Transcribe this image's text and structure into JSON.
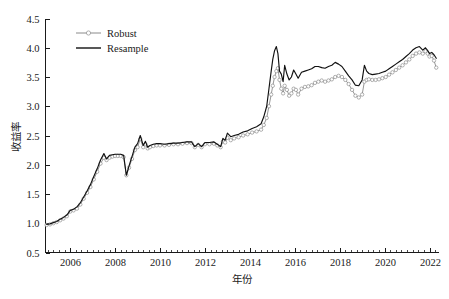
{
  "chart_data": {
    "type": "line",
    "title": "",
    "xlabel": "年份",
    "ylabel": "收益率",
    "xlim": [
      2004.9,
      2022.4
    ],
    "ylim": [
      0.5,
      4.5
    ],
    "grid": false,
    "legend_position": "top-left",
    "x_ticks": [
      2006,
      2008,
      2010,
      2012,
      2014,
      2016,
      2018,
      2020,
      2022
    ],
    "x_tick_labels": [
      "2006",
      "2008",
      "2010",
      "2012",
      "2014",
      "2016",
      "2018",
      "2020",
      "2022"
    ],
    "x_minor_tick_step": 0.25,
    "y_ticks": [
      0.5,
      1.0,
      1.5,
      2.0,
      2.5,
      3.0,
      3.5,
      4.0,
      4.5
    ],
    "y_tick_labels": [
      "0.5",
      "1.0",
      "1.5",
      "2.0",
      "2.5",
      "3.0",
      "3.5",
      "4.0",
      "4.5"
    ],
    "series": [
      {
        "name": "Robust",
        "color": "#8a8a8a",
        "marker": "open-circle",
        "x": [
          2004.95,
          2005.1,
          2005.25,
          2005.4,
          2005.55,
          2005.7,
          2005.85,
          2006.0,
          2006.15,
          2006.3,
          2006.45,
          2006.6,
          2006.75,
          2006.9,
          2007.05,
          2007.2,
          2007.35,
          2007.5,
          2007.62,
          2007.75,
          2007.88,
          2008.0,
          2008.12,
          2008.25,
          2008.38,
          2008.5,
          2008.62,
          2008.75,
          2008.88,
          2009.0,
          2009.12,
          2009.25,
          2009.35,
          2009.45,
          2009.55,
          2009.7,
          2009.85,
          2010.0,
          2010.2,
          2010.4,
          2010.6,
          2010.8,
          2011.0,
          2011.2,
          2011.4,
          2011.55,
          2011.7,
          2011.85,
          2012.0,
          2012.2,
          2012.4,
          2012.55,
          2012.7,
          2012.8,
          2012.9,
          2013.0,
          2013.15,
          2013.3,
          2013.5,
          2013.7,
          2013.9,
          2014.1,
          2014.3,
          2014.5,
          2014.62,
          2014.75,
          2014.85,
          2014.95,
          2015.02,
          2015.1,
          2015.18,
          2015.25,
          2015.32,
          2015.4,
          2015.48,
          2015.55,
          2015.65,
          2015.75,
          2015.85,
          2015.95,
          2016.05,
          2016.15,
          2016.3,
          2016.45,
          2016.6,
          2016.75,
          2016.9,
          2017.05,
          2017.2,
          2017.35,
          2017.5,
          2017.65,
          2017.8,
          2017.95,
          2018.1,
          2018.25,
          2018.4,
          2018.55,
          2018.7,
          2018.85,
          2019.0,
          2019.1,
          2019.2,
          2019.3,
          2019.45,
          2019.6,
          2019.75,
          2019.9,
          2020.05,
          2020.2,
          2020.35,
          2020.5,
          2020.65,
          2020.8,
          2020.95,
          2021.1,
          2021.25,
          2021.4,
          2021.55,
          2021.7,
          2021.82,
          2021.92,
          2022.0,
          2022.1,
          2022.2,
          2022.3
        ],
        "y": [
          0.97,
          0.98,
          1.0,
          1.02,
          1.05,
          1.08,
          1.12,
          1.2,
          1.22,
          1.25,
          1.32,
          1.42,
          1.52,
          1.62,
          1.75,
          1.88,
          2.02,
          2.12,
          2.08,
          2.12,
          2.14,
          2.15,
          2.15,
          2.15,
          2.13,
          1.82,
          1.95,
          2.1,
          2.25,
          2.3,
          2.44,
          2.3,
          2.35,
          2.28,
          2.3,
          2.32,
          2.33,
          2.33,
          2.33,
          2.34,
          2.35,
          2.35,
          2.36,
          2.37,
          2.37,
          2.3,
          2.34,
          2.3,
          2.35,
          2.35,
          2.36,
          2.33,
          2.3,
          2.4,
          2.38,
          2.46,
          2.42,
          2.45,
          2.47,
          2.5,
          2.52,
          2.55,
          2.57,
          2.6,
          2.68,
          2.8,
          3.0,
          3.2,
          3.35,
          3.5,
          3.6,
          3.65,
          3.45,
          3.3,
          3.22,
          3.35,
          3.28,
          3.18,
          3.22,
          3.3,
          3.28,
          3.2,
          3.3,
          3.33,
          3.34,
          3.36,
          3.4,
          3.42,
          3.44,
          3.42,
          3.44,
          3.46,
          3.5,
          3.52,
          3.5,
          3.45,
          3.38,
          3.28,
          3.18,
          3.15,
          3.2,
          3.42,
          3.45,
          3.46,
          3.45,
          3.45,
          3.46,
          3.48,
          3.5,
          3.54,
          3.58,
          3.62,
          3.66,
          3.7,
          3.75,
          3.8,
          3.86,
          3.9,
          3.92,
          3.9,
          3.94,
          3.9,
          3.85,
          3.86,
          3.78,
          3.66
        ]
      },
      {
        "name": "Resample",
        "color": "#111111",
        "marker": "none",
        "x": [
          2004.95,
          2005.1,
          2005.25,
          2005.4,
          2005.55,
          2005.7,
          2005.85,
          2006.0,
          2006.15,
          2006.3,
          2006.45,
          2006.6,
          2006.75,
          2006.9,
          2007.05,
          2007.2,
          2007.35,
          2007.5,
          2007.62,
          2007.75,
          2007.88,
          2008.0,
          2008.12,
          2008.25,
          2008.38,
          2008.5,
          2008.62,
          2008.75,
          2008.88,
          2009.0,
          2009.12,
          2009.25,
          2009.35,
          2009.45,
          2009.55,
          2009.7,
          2009.85,
          2010.0,
          2010.2,
          2010.4,
          2010.6,
          2010.8,
          2011.0,
          2011.2,
          2011.4,
          2011.55,
          2011.7,
          2011.85,
          2012.0,
          2012.2,
          2012.4,
          2012.55,
          2012.7,
          2012.8,
          2012.9,
          2013.0,
          2013.15,
          2013.3,
          2013.5,
          2013.7,
          2013.9,
          2014.1,
          2014.3,
          2014.5,
          2014.62,
          2014.75,
          2014.85,
          2014.95,
          2015.02,
          2015.1,
          2015.18,
          2015.25,
          2015.32,
          2015.4,
          2015.48,
          2015.55,
          2015.65,
          2015.75,
          2015.85,
          2015.95,
          2016.05,
          2016.15,
          2016.3,
          2016.45,
          2016.6,
          2016.75,
          2016.9,
          2017.05,
          2017.2,
          2017.35,
          2017.5,
          2017.65,
          2017.8,
          2017.95,
          2018.1,
          2018.25,
          2018.4,
          2018.55,
          2018.7,
          2018.85,
          2019.0,
          2019.1,
          2019.2,
          2019.3,
          2019.45,
          2019.6,
          2019.75,
          2019.9,
          2020.05,
          2020.2,
          2020.35,
          2020.5,
          2020.65,
          2020.8,
          2020.95,
          2021.1,
          2021.25,
          2021.4,
          2021.55,
          2021.7,
          2021.82,
          2021.92,
          2022.0,
          2022.1,
          2022.2,
          2022.3
        ],
        "y": [
          0.98,
          0.99,
          1.01,
          1.03,
          1.07,
          1.1,
          1.14,
          1.22,
          1.24,
          1.28,
          1.35,
          1.45,
          1.55,
          1.66,
          1.8,
          1.93,
          2.08,
          2.19,
          2.1,
          2.16,
          2.17,
          2.18,
          2.18,
          2.18,
          2.16,
          1.82,
          1.98,
          2.14,
          2.3,
          2.36,
          2.5,
          2.33,
          2.4,
          2.3,
          2.33,
          2.35,
          2.36,
          2.36,
          2.35,
          2.36,
          2.37,
          2.37,
          2.38,
          2.39,
          2.39,
          2.31,
          2.36,
          2.31,
          2.38,
          2.38,
          2.39,
          2.35,
          2.31,
          2.45,
          2.42,
          2.54,
          2.48,
          2.5,
          2.52,
          2.56,
          2.58,
          2.62,
          2.65,
          2.7,
          2.82,
          3.0,
          3.3,
          3.6,
          3.8,
          3.95,
          4.02,
          3.9,
          3.6,
          3.55,
          3.42,
          3.7,
          3.55,
          3.45,
          3.5,
          3.62,
          3.55,
          3.48,
          3.58,
          3.6,
          3.62,
          3.64,
          3.68,
          3.68,
          3.66,
          3.65,
          3.68,
          3.7,
          3.75,
          3.72,
          3.68,
          3.6,
          3.52,
          3.45,
          3.36,
          3.35,
          3.45,
          3.7,
          3.6,
          3.56,
          3.54,
          3.55,
          3.56,
          3.58,
          3.6,
          3.64,
          3.68,
          3.72,
          3.76,
          3.8,
          3.85,
          3.9,
          3.96,
          4.0,
          4.02,
          3.96,
          4.0,
          3.95,
          3.9,
          3.92,
          3.88,
          3.82
        ]
      }
    ]
  },
  "legend": {
    "items": [
      {
        "label": "Robust",
        "style": "line-with-open-circle-marker",
        "color": "#8a8a8a"
      },
      {
        "label": "Resample",
        "style": "solid-line",
        "color": "#111111"
      }
    ]
  },
  "axes": {
    "y_title": "收益率",
    "x_title": "年份"
  }
}
